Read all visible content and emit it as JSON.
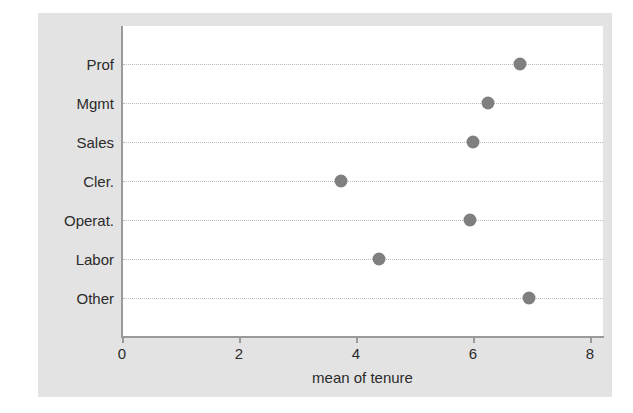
{
  "chart_data": {
    "type": "scatter",
    "title": "",
    "subtitle": "",
    "xlabel": "mean of tenure",
    "ylabel": "",
    "categories": [
      "Prof",
      "Mgmt",
      "Sales",
      "Cler.",
      "Operat.",
      "Labor",
      "Other"
    ],
    "values": [
      6.8,
      6.25,
      6.0,
      3.75,
      5.95,
      4.4,
      6.95
    ],
    "series": [
      {
        "name": "mean of tenure",
        "values": [
          6.8,
          6.25,
          6.0,
          3.75,
          5.95,
          4.4,
          6.95
        ]
      }
    ],
    "xlim": [
      0,
      8
    ],
    "xticks": [
      0,
      2,
      4,
      6,
      8
    ],
    "xtick_labels": [
      "0",
      "2",
      "4",
      "6",
      "8"
    ],
    "grid": "horizontal-dotted",
    "legend": "none",
    "marker_color": "#7f7f7f",
    "panel_color": "#e3e3e3",
    "plot_color": "#ffffff",
    "axis_color": "#9a9a9a",
    "grid_color": "#b9b9b9",
    "text_color": "#2b2b2b"
  }
}
